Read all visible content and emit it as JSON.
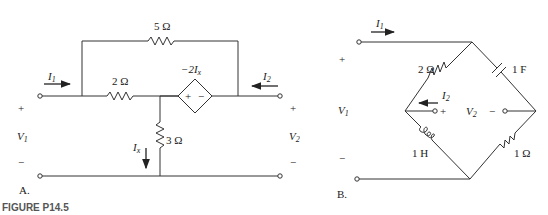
{
  "figure_caption": "FIGURE P14.5",
  "circuit_a": {
    "label": "A.",
    "r_top": "5 Ω",
    "r_series": "2 Ω",
    "r_shunt": "3 Ω",
    "dep_source": "−2I",
    "dep_source_sub": "x",
    "dep_plus": "+",
    "dep_minus": "−",
    "i1": "I",
    "i1_sub": "1",
    "i2": "I",
    "i2_sub": "2",
    "ix": "I",
    "ix_sub": "x",
    "v1": "V",
    "v1_sub": "1",
    "v2": "V",
    "v2_sub": "2",
    "plus": "+",
    "minus": "−"
  },
  "circuit_b": {
    "label": "B.",
    "r_upper_left": "2 Ω",
    "c_upper_right": "1 F",
    "l_lower_left": "1 H",
    "r_lower_right": "1 Ω",
    "i1": "I",
    "i1_sub": "1",
    "i2": "I",
    "i2_sub": "2",
    "v1": "V",
    "v1_sub": "1",
    "v2": "V",
    "v2_sub": "2",
    "plus": "+",
    "minus": "−"
  }
}
